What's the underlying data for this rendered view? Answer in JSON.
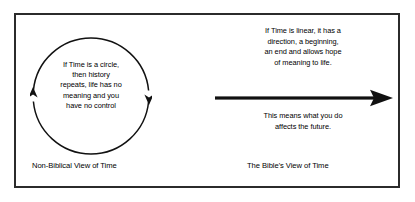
{
  "diagram": {
    "border_color": "#2b2b2b",
    "background_color": "#ffffff",
    "text_color": "#000000",
    "panels": {
      "non_biblical": {
        "caption": "Non-Biblical View of Time",
        "circle_text": "If Time is a circle,\nthen history\nrepeats, life has no\nmeaning and you\nhave no control",
        "shape": "circle-with-clockwise-arrows"
      },
      "biblical": {
        "caption": "The Bible's View of Time",
        "text_above_arrow": "If Time is linear, it has a\ndirection, a beginning,\nan end and allows hope\nof meaning to life.",
        "text_below_arrow": "This means what you do\naffects the future.",
        "shape": "right-pointing-arrow"
      }
    }
  }
}
